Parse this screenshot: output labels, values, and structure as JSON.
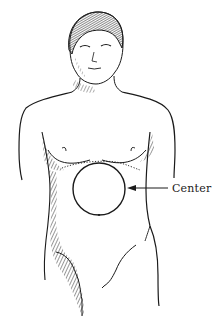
{
  "figure": {
    "annotation": {
      "label": "Center",
      "target": "circle-region"
    },
    "colors": {
      "ink": "#1a1a1a",
      "background": "#ffffff"
    }
  }
}
